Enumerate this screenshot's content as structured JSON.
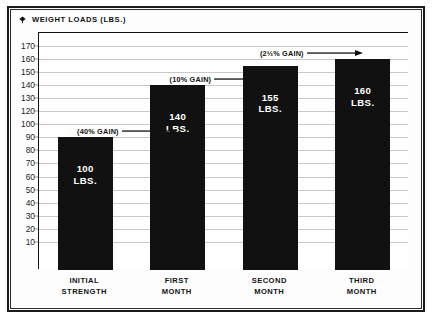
{
  "title": {
    "text": "WEIGHT LOADS (LBS.)",
    "marker_icon": "diamond-bullet-icon"
  },
  "chart_data": {
    "type": "bar",
    "title": "WEIGHT LOADS (LBS.)",
    "xlabel": "",
    "ylabel": "",
    "ylim": [
      10,
      170
    ],
    "grid": true,
    "legend": "none",
    "categories": [
      "INITIAL STRENGTH",
      "FIRST MONTH",
      "SECOND MONTH",
      "THIRD MONTH"
    ],
    "category_lines": [
      [
        "INITIAL",
        "STRENGTH"
      ],
      [
        "FIRST",
        "MONTH"
      ],
      [
        "SECOND",
        "MONTH"
      ],
      [
        "THIRD",
        "MONTH"
      ]
    ],
    "values": [
      100,
      140,
      155,
      160
    ],
    "value_labels": [
      "100",
      "140",
      "155",
      "160"
    ],
    "unit_label": "LBS.",
    "bar_color": "#111111",
    "bar_text_color": "#ffffff",
    "ytick_labels": [
      "170",
      "160",
      "150",
      "140",
      "130",
      "120",
      "100",
      "90",
      "80",
      "70",
      "60",
      "50",
      "40",
      "30",
      "20",
      "10"
    ],
    "ytick_values": [
      170,
      160,
      150,
      140,
      130,
      120,
      110,
      100,
      90,
      80,
      70,
      60,
      50,
      40,
      30,
      20
    ],
    "annotations": [
      {
        "text": "(40% GAIN)",
        "at_value": 100,
        "target_bar": 1
      },
      {
        "text": "(10% GAIN)",
        "at_value": 140,
        "target_bar": 2
      },
      {
        "text": "(2⅓% GAIN)",
        "at_value": 160,
        "target_bar": 3
      }
    ]
  },
  "colors": {
    "bar": "#111111",
    "gridline": "#c9c9c9",
    "frame": "#1a1a1a",
    "background": "#ffffff"
  }
}
